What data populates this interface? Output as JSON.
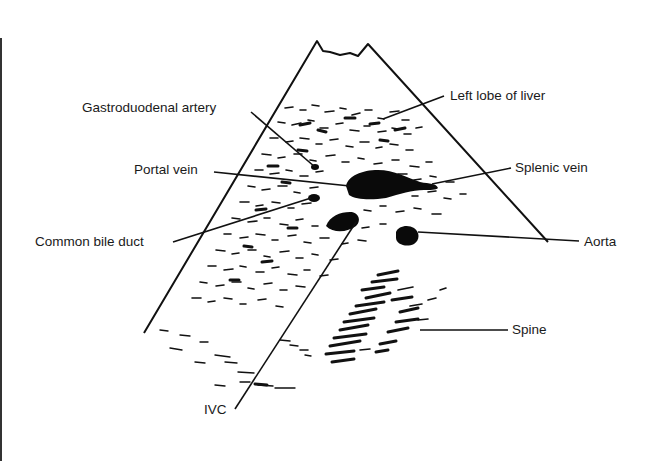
{
  "diagram": {
    "type": "labeled ultrasound schematic (transverse upper abdomen, sector scan)",
    "colors": {
      "ink": "#111111",
      "background": "#ffffff"
    },
    "labels": {
      "gastroduodenal_artery": "Gastroduodenal artery",
      "left_lobe_of_liver": "Left lobe of liver",
      "portal_vein": "Portal vein",
      "splenic_vein": "Splenic vein",
      "common_bile_duct": "Common bile duct",
      "aorta": "Aorta",
      "spine": "Spine",
      "ivc": "IVC"
    }
  }
}
